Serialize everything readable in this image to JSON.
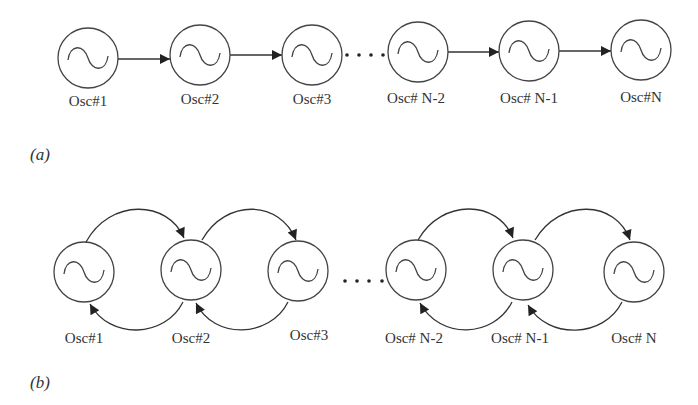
{
  "figure": {
    "panel_a": {
      "label": "(a)",
      "topology": "unidirectional chain",
      "nodes": [
        "Osc#1",
        "Osc#2",
        "Osc#3",
        "Osc# N-2",
        "Osc# N-1",
        "Osc#N"
      ],
      "ellipsis": "....",
      "links": [
        {
          "from": "Osc#1",
          "to": "Osc#2"
        },
        {
          "from": "Osc#2",
          "to": "Osc#3"
        },
        {
          "from": "Osc# N-2",
          "to": "Osc# N-1"
        },
        {
          "from": "Osc# N-1",
          "to": "Osc#N"
        }
      ]
    },
    "panel_b": {
      "label": "(b)",
      "topology": "bidirectional chain",
      "nodes": [
        "Osc#1",
        "Osc#2",
        "Osc#3",
        "Osc# N-2",
        "Osc# N-1",
        "Osc# N"
      ],
      "ellipsis": "....",
      "links": [
        {
          "from": "Osc#1",
          "to": "Osc#2",
          "path": "upper"
        },
        {
          "from": "Osc#2",
          "to": "Osc#1",
          "path": "lower"
        },
        {
          "from": "Osc#2",
          "to": "Osc#3",
          "path": "upper"
        },
        {
          "from": "Osc#3",
          "to": "Osc#2",
          "path": "lower"
        },
        {
          "from": "Osc# N-2",
          "to": "Osc# N-1",
          "path": "upper"
        },
        {
          "from": "Osc# N-1",
          "to": "Osc# N-2",
          "path": "lower"
        },
        {
          "from": "Osc# N-1",
          "to": "Osc# N",
          "path": "upper"
        },
        {
          "from": "Osc# N",
          "to": "Osc# N-1",
          "path": "lower"
        }
      ]
    },
    "node_icon": "ac-sine-source-icon",
    "colors": {
      "stroke": "#444444",
      "text": "#333333",
      "background": "#ffffff"
    }
  }
}
